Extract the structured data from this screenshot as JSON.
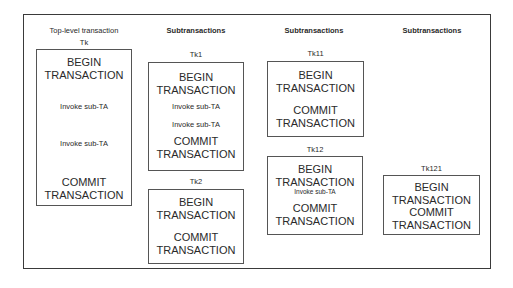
{
  "columns": [
    {
      "header": "Top-level transaction",
      "bold": false
    },
    {
      "header": "Subtransactions",
      "bold": true
    },
    {
      "header": "Subtransactions",
      "bold": true
    },
    {
      "header": "Subtransactions",
      "bold": true
    }
  ],
  "transactions": {
    "tk": {
      "label": "Tk",
      "begin1": "BEGIN",
      "begin2": "TRANSACTION",
      "invoke1": "Invoke sub-TA",
      "invoke2": "Invoke sub-TA",
      "commit1": "COMMIT",
      "commit2": "TRANSACTION"
    },
    "tk1": {
      "label": "Tk1",
      "begin1": "BEGIN",
      "begin2": "TRANSACTION",
      "invoke1": "Invoke sub-TA",
      "invoke2": "Invoke sub-TA",
      "commit1": "COMMIT",
      "commit2": "TRANSACTION"
    },
    "tk2": {
      "label": "Tk2",
      "begin1": "BEGIN",
      "begin2": "TRANSACTION",
      "commit1": "COMMIT",
      "commit2": "TRANSACTION"
    },
    "tk11": {
      "label": "Tk11",
      "begin1": "BEGIN",
      "begin2": "TRANSACTION",
      "commit1": "COMMIT",
      "commit2": "TRANSACTION"
    },
    "tk12": {
      "label": "Tk12",
      "begin1": "BEGIN",
      "begin2": "TRANSACTION",
      "invoke1": "Invoke sub-TA",
      "commit1": "COMMIT",
      "commit2": "TRANSACTION"
    },
    "tk121": {
      "label": "Tk121",
      "begin1": "BEGIN",
      "begin2": "TRANSACTION",
      "commit1": "COMMIT",
      "commit2": "TRANSACTION"
    }
  }
}
